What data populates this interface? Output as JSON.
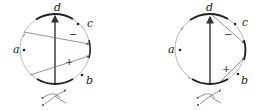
{
  "diagrams": [
    {
      "id": "left",
      "labels": {
        "a": "a",
        "b": "b",
        "c": "c",
        "d": "d"
      },
      "signs": {
        "minus": "−",
        "plus": "+"
      }
    },
    {
      "id": "right",
      "labels": {
        "a": "a",
        "b": "b",
        "c": "c",
        "d": "d"
      },
      "signs": {
        "minus": "−",
        "plus": "+"
      }
    }
  ],
  "colors": {
    "thin": "#999999",
    "thick": "#222222",
    "arrow": "#555555"
  }
}
